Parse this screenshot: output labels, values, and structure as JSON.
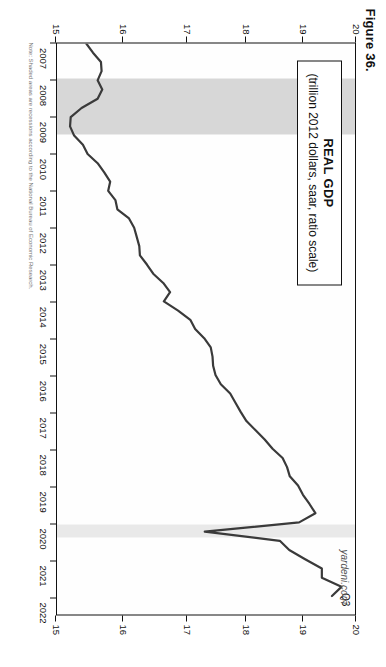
{
  "figure": {
    "number_label": "Figure 36.",
    "watermark": "yardeni.com",
    "source_note": "Note: Shaded areas are recessions according to the National Bureau of Economic Research."
  },
  "legend": {
    "title": "REAL GDP",
    "subtitle": "(trillion 2012 dollars, saar, ratio scale)"
  },
  "annotations": {
    "latest_point_label": "Q3"
  },
  "axes": {
    "y_left_ticks": [
      "20",
      "19",
      "18",
      "17",
      "16",
      "15"
    ],
    "y_right_ticks": [
      "20",
      "19",
      "18",
      "17",
      "16",
      "15"
    ],
    "x_ticks": [
      "2007",
      "2008",
      "2009",
      "2010",
      "2011",
      "2012",
      "2013",
      "2014",
      "2015",
      "2016",
      "2017",
      "2018",
      "2019",
      "2020",
      "2021",
      "2022"
    ]
  },
  "colors": {
    "line": "#3a3a3a",
    "recession_band": "#d7d7d7",
    "recession_band_light": "#e9e9e9",
    "axis": "#111111",
    "plot_background": "#fefefe"
  },
  "chart_data": {
    "type": "line",
    "title": "REAL GDP",
    "subtitle": "(trillion 2012 dollars, saar, ratio scale)",
    "xlabel": "",
    "ylabel": "trillion 2012 dollars",
    "ylim": [
      15,
      20
    ],
    "xlim": [
      2007,
      2022.5
    ],
    "yscale": "log (ratio scale)",
    "grid": false,
    "legend_position": "inside-top-left",
    "recessions": [
      {
        "start": 2007.95,
        "end": 2009.45
      },
      {
        "start": 2020.0,
        "end": 2020.35
      }
    ],
    "series": [
      {
        "name": "Real GDP",
        "x": [
          2007.0,
          2007.25,
          2007.5,
          2007.75,
          2008.0,
          2008.25,
          2008.5,
          2008.75,
          2009.0,
          2009.25,
          2009.5,
          2009.75,
          2010.0,
          2010.25,
          2010.5,
          2010.75,
          2011.0,
          2011.25,
          2011.5,
          2011.75,
          2012.0,
          2012.25,
          2012.5,
          2012.75,
          2013.0,
          2013.25,
          2013.5,
          2013.75,
          2014.0,
          2014.25,
          2014.5,
          2014.75,
          2015.0,
          2015.25,
          2015.5,
          2015.75,
          2016.0,
          2016.25,
          2016.5,
          2016.75,
          2017.0,
          2017.25,
          2017.5,
          2017.75,
          2018.0,
          2018.25,
          2018.5,
          2018.75,
          2019.0,
          2019.25,
          2019.5,
          2019.75,
          2020.0,
          2020.25,
          2020.5,
          2020.75,
          2021.0,
          2021.25,
          2021.5,
          2021.75,
          2022.0
        ],
        "y": [
          15.43,
          15.53,
          15.65,
          15.66,
          15.6,
          15.67,
          15.6,
          15.36,
          15.2,
          15.19,
          15.25,
          15.38,
          15.45,
          15.6,
          15.7,
          15.79,
          15.76,
          15.87,
          15.9,
          16.08,
          16.16,
          16.2,
          16.24,
          16.25,
          16.36,
          16.46,
          16.62,
          16.73,
          16.63,
          16.86,
          17.06,
          17.14,
          17.29,
          17.4,
          17.43,
          17.44,
          17.48,
          17.57,
          17.73,
          17.82,
          17.91,
          18.01,
          18.17,
          18.33,
          18.47,
          18.65,
          18.73,
          18.78,
          18.93,
          19.02,
          19.14,
          19.25,
          18.95,
          17.3,
          18.6,
          18.77,
          19.06,
          19.37,
          19.37,
          19.74,
          19.56
        ],
        "label_last": "Q3",
        "color": "#3a3a3a",
        "style": "solid",
        "width": 2.2
      }
    ]
  }
}
